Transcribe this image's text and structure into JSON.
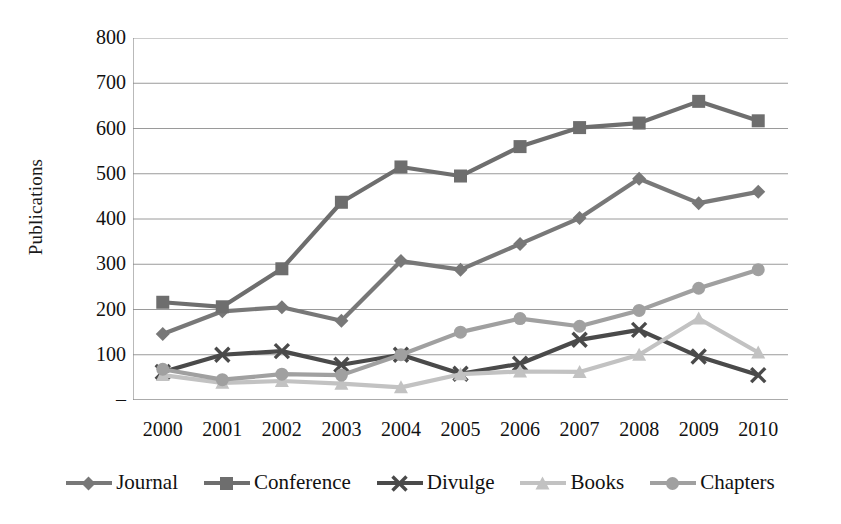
{
  "chart_data": {
    "type": "line",
    "title": "",
    "xlabel": "",
    "ylabel": "Publications",
    "categories": [
      "2000",
      "2001",
      "2002",
      "2003",
      "2004",
      "2005",
      "2006",
      "2007",
      "2008",
      "2009",
      "2010"
    ],
    "ylim": [
      0,
      800
    ],
    "ytick_labels": [
      "800",
      "700",
      "600",
      "500",
      "400",
      "300",
      "200",
      "100",
      "–"
    ],
    "ytick_values": [
      800,
      700,
      600,
      500,
      400,
      300,
      200,
      100,
      0
    ],
    "grid": true,
    "legend_position": "bottom",
    "series": [
      {
        "name": "Journal",
        "marker": "diamond",
        "color": "#787878",
        "values": [
          146,
          196,
          205,
          175,
          307,
          288,
          345,
          402,
          489,
          435,
          460
        ]
      },
      {
        "name": "Conference",
        "marker": "square",
        "color": "#6e6e6e",
        "values": [
          216,
          206,
          290,
          437,
          515,
          495,
          560,
          602,
          612,
          660,
          617
        ]
      },
      {
        "name": "Divulge",
        "marker": "x",
        "color": "#4a4a4a",
        "values": [
          62,
          100,
          108,
          78,
          100,
          58,
          80,
          133,
          155,
          96,
          55
        ]
      },
      {
        "name": "Books",
        "marker": "triangle",
        "color": "#c2c2c2",
        "values": [
          55,
          38,
          42,
          36,
          28,
          57,
          63,
          62,
          100,
          180,
          105
        ]
      },
      {
        "name": "Chapters",
        "marker": "circle",
        "color": "#a0a0a0",
        "values": [
          68,
          45,
          57,
          55,
          100,
          150,
          180,
          163,
          198,
          247,
          288
        ]
      }
    ]
  },
  "legend": {
    "items": [
      {
        "label": "Journal"
      },
      {
        "label": "Conference"
      },
      {
        "label": "Divulge"
      },
      {
        "label": "Books"
      },
      {
        "label": "Chapters"
      }
    ]
  },
  "axes": {
    "y_title": "Publications"
  }
}
